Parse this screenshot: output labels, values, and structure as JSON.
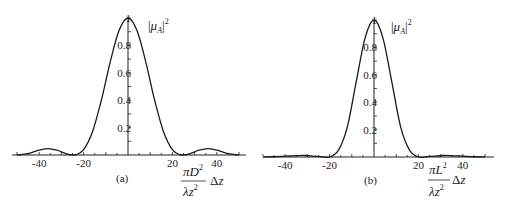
{
  "chart_data": [
    {
      "type": "line",
      "panel_label": "(a)",
      "ylabel": "|μ_A|^2",
      "xlabel": "πD²/(λz²) Δz",
      "xlabel_parts": {
        "num": "πD",
        "num_sup": "2",
        "den": "λz",
        "den_sup": "2",
        "suffix": "Δz"
      },
      "xlim": [
        -50,
        50
      ],
      "ylim": [
        0,
        1
      ],
      "x_ticks": [
        -40,
        -20,
        20,
        40
      ],
      "x_tick_labels": [
        "-40",
        "-20",
        "20",
        "40"
      ],
      "y_ticks": [
        0.2,
        0.4,
        0.6,
        0.8,
        1
      ],
      "y_tick_labels": [
        "0.2",
        "0.4",
        "0.6",
        "0.8",
        "1"
      ],
      "grid": false,
      "description": "Central lobe peaking at 1 at Δz=0, first zeros near ±24, side lobes ~0.05 near ±36",
      "series": [
        {
          "name": "|mu_A|^2 (a)",
          "x": [
            -50,
            -45,
            -40,
            -36,
            -32,
            -28,
            -24,
            -20,
            -16,
            -12,
            -8,
            -4,
            0,
            4,
            8,
            12,
            16,
            20,
            24,
            28,
            32,
            36,
            40,
            45,
            50
          ],
          "y": [
            0.0,
            0.01,
            0.035,
            0.047,
            0.035,
            0.01,
            0.0,
            0.04,
            0.17,
            0.4,
            0.68,
            0.91,
            1.0,
            0.91,
            0.68,
            0.4,
            0.17,
            0.04,
            0.0,
            0.01,
            0.035,
            0.047,
            0.035,
            0.01,
            0.0
          ]
        }
      ]
    },
    {
      "type": "line",
      "panel_label": "(b)",
      "ylabel": "|μ_A|^2",
      "xlabel": "πL²/(λz²) Δz",
      "xlabel_parts": {
        "num": "πL",
        "num_sup": "2",
        "den": "λz",
        "den_sup": "2",
        "suffix": "Δz"
      },
      "xlim": [
        -50,
        50
      ],
      "ylim": [
        0,
        1
      ],
      "x_ticks": [
        -40,
        -20,
        20,
        40
      ],
      "x_tick_labels": [
        "-40",
        "-20",
        "20",
        "40"
      ],
      "y_ticks": [
        0.2,
        0.4,
        0.6,
        0.8,
        1
      ],
      "y_tick_labels": [
        "0.2",
        "0.4",
        "0.6",
        "0.8",
        "1"
      ],
      "grid": false,
      "description": "Narrower central lobe peaking at 1 at Δz=0, first zeros near ±20, very small side lobes ~0.01 near ±31",
      "series": [
        {
          "name": "|mu_A|^2 (b)",
          "x": [
            -50,
            -45,
            -40,
            -35,
            -31,
            -25,
            -20,
            -16,
            -12,
            -8,
            -4,
            0,
            4,
            8,
            12,
            16,
            20,
            25,
            31,
            35,
            40,
            45,
            50
          ],
          "y": [
            0.0,
            0.002,
            0.006,
            0.01,
            0.011,
            0.004,
            0.0,
            0.05,
            0.22,
            0.55,
            0.87,
            1.0,
            0.87,
            0.55,
            0.22,
            0.05,
            0.0,
            0.004,
            0.011,
            0.01,
            0.006,
            0.002,
            0.0
          ]
        }
      ]
    }
  ],
  "panels": {
    "a": {
      "label": "(a)",
      "ylabel_main": "μ",
      "ylabel_sub": "A",
      "ylabel_sup": "2"
    },
    "b": {
      "label": "(b)",
      "ylabel_main": "μ",
      "ylabel_sub": "A",
      "ylabel_sup": "2"
    }
  }
}
